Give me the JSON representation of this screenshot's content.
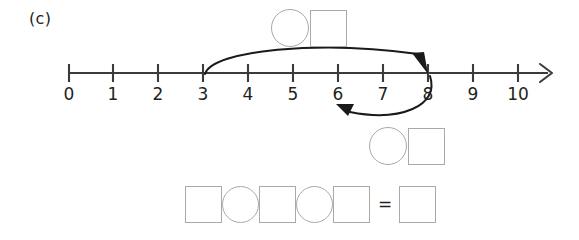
{
  "part": {
    "label": "(c)"
  },
  "number_line": {
    "ticks": [
      {
        "value": "0"
      },
      {
        "value": "1"
      },
      {
        "value": "2"
      },
      {
        "value": "3"
      },
      {
        "value": "4"
      },
      {
        "value": "5"
      },
      {
        "value": "6"
      },
      {
        "value": "7"
      },
      {
        "value": "8"
      },
      {
        "value": "9"
      },
      {
        "value": "10"
      }
    ],
    "min": 0,
    "max": 10,
    "axis_color": "#3b3b3b",
    "has_end_arrow": true
  },
  "jumps": [
    {
      "name": "forward-jump",
      "from": 3,
      "to": 8,
      "direction": "right",
      "position": "above-line"
    },
    {
      "name": "backward-jump",
      "from": 8,
      "to": 6,
      "direction": "left",
      "position": "below-line"
    }
  ],
  "answer_boxes": {
    "top_pair": {
      "shapes": [
        "circle",
        "square"
      ]
    },
    "middle_pair": {
      "shapes": [
        "circle",
        "square"
      ]
    }
  },
  "equation": {
    "shapes": [
      "square",
      "circle",
      "square",
      "circle",
      "square"
    ],
    "equals_sign": "=",
    "result_shape": "square"
  },
  "colors": {
    "shape_outline": "#a9a9a9",
    "ink": "#231f20",
    "line": "#3b3b3b"
  }
}
